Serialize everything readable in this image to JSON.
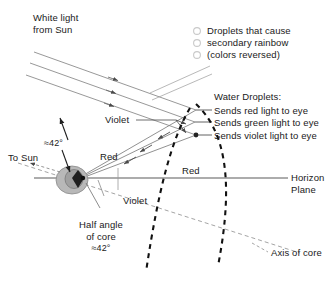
{
  "diagram": {
    "colors": {
      "ray_gray": "#8c8c8c",
      "line_dark": "#222222",
      "droplet_fill": "#d9d9d9",
      "droplet_stroke": "#9e9e9e",
      "observer_fill": "#b3b3b3",
      "observer_stroke": "#7a7a7a",
      "dashed_thin": "#9a9a9a",
      "dashed_thick": "#111111",
      "text": "#1a1a1a"
    },
    "labels": {
      "white_light": "White light\nfrom Sun",
      "white_light_line1": "White light",
      "white_light_line2": "from Sun",
      "secondary_droplets_line1": "Droplets that cause",
      "secondary_droplets_line2": "secondary rainbow",
      "secondary_droplets_line3": "(colors reversed)",
      "water_droplets_heading": "Water Droplets:",
      "sends_red": "Sends red light to eye",
      "sends_green": "Sends green light to eye",
      "sends_violet": "Sends violet light to eye",
      "violet_upper": "Violet",
      "violet_lower": "Violet",
      "red_upper": "Red",
      "red_lower": "Red",
      "to_sun": "To Sun",
      "angle_upper": "≈42°",
      "half_angle_line1": "Half angle",
      "half_angle_line2": "of core",
      "half_angle_line3": "≈42°",
      "horizon_line1": "Horizon",
      "horizon_line2": "Plane",
      "axis_of_core": "Axis of core"
    },
    "geometry": {
      "horizon_y": 178,
      "observer_x": 76,
      "observer_y": 178,
      "droplet_points": [
        {
          "name": "red-droplet",
          "x": 195,
          "y": 110
        },
        {
          "name": "green-droplet",
          "x": 195,
          "y": 122
        },
        {
          "name": "violet-droplet",
          "x": 196,
          "y": 135
        }
      ],
      "secondary_droplet_circles": [
        {
          "x": 197,
          "y": 31
        },
        {
          "x": 197,
          "y": 43
        },
        {
          "x": 197,
          "y": 55
        }
      ]
    }
  }
}
